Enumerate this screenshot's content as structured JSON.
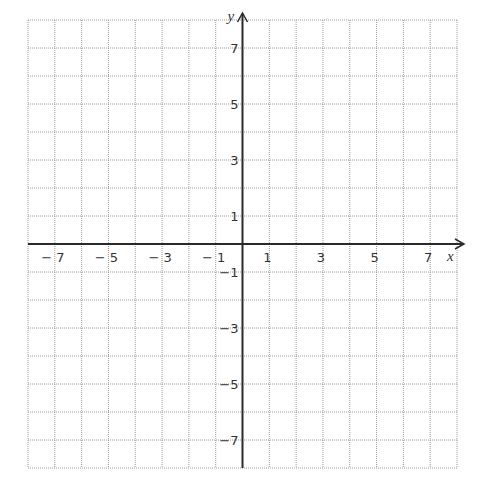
{
  "chart_data": {
    "type": "scatter",
    "title": "",
    "xlabel": "x",
    "ylabel": "y",
    "xlim": [
      -8,
      8
    ],
    "ylim": [
      -8,
      8
    ],
    "grid": true,
    "grid_style": "dotted",
    "grid_step": 1,
    "x_tick_labels": [
      "-7",
      "-5",
      "-3",
      "-1",
      "1",
      "3",
      "5",
      "7"
    ],
    "x_tick_values": [
      -7,
      -5,
      -3,
      -1,
      1,
      3,
      5,
      7
    ],
    "y_tick_labels": [
      "7",
      "5",
      "3",
      "1",
      "-1",
      "-3",
      "-5",
      "-7"
    ],
    "y_tick_values": [
      7,
      5,
      3,
      1,
      -1,
      -3,
      -5,
      -7
    ],
    "series": [],
    "legend": null
  },
  "colors": {
    "grid": "#9a9a9a",
    "axis": "#2a2a2a",
    "text": "#333333",
    "background": "#ffffff"
  }
}
